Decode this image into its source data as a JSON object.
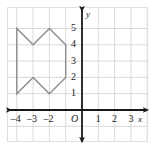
{
  "chart_data": {
    "type": "scatter",
    "title": "",
    "xlabel": "x",
    "ylabel": "y",
    "xlim": [
      -4.8,
      3.8
    ],
    "ylim": [
      -1.6,
      5.8
    ],
    "grid": true,
    "legend": null,
    "x_ticks": [
      {
        "value": -4,
        "label": "–4"
      },
      {
        "value": -3,
        "label": "–3"
      },
      {
        "value": -2,
        "label": "–2"
      },
      {
        "value": 1,
        "label": "1"
      },
      {
        "value": 2,
        "label": "2"
      },
      {
        "value": 3,
        "label": "3"
      }
    ],
    "y_ticks": [
      {
        "value": 1,
        "label": "1"
      },
      {
        "value": 2,
        "label": "2"
      },
      {
        "value": 3,
        "label": "3"
      },
      {
        "value": 4,
        "label": "4"
      },
      {
        "value": 5,
        "label": "5"
      }
    ],
    "origin_label": "O",
    "shapes": [
      {
        "name": "polygon-figure",
        "type": "polygon",
        "closed": true,
        "stroke": "#8c8c8c",
        "fill": "none",
        "vertices": [
          [
            -4,
            5
          ],
          [
            -3,
            4
          ],
          [
            -2,
            5
          ],
          [
            -1,
            4
          ],
          [
            -1,
            2
          ],
          [
            -2,
            1
          ],
          [
            -3,
            2
          ],
          [
            -4,
            1
          ]
        ]
      }
    ],
    "colors": {
      "grid": "#d9d9d9",
      "axis": "#1a1a1a",
      "shape_stroke": "#8c8c8c",
      "frame": "#e0e0e0",
      "background": "#ffffff"
    }
  }
}
